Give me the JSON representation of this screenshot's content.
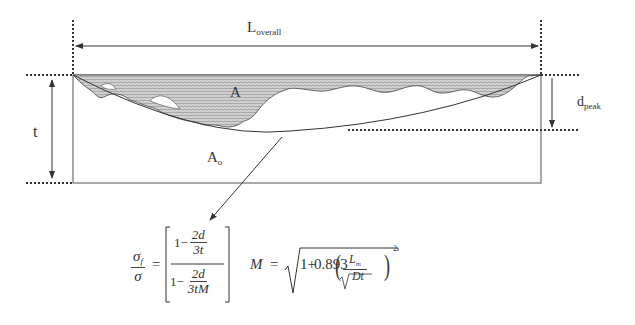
{
  "diagram": {
    "labels": {
      "length_main": "L",
      "length_sub": "overall",
      "area_corroded": "A",
      "area_original_main": "A",
      "area_original_sub": "o",
      "thickness": "t",
      "depth_main": "d",
      "depth_sub": "peak"
    },
    "formula_stress": {
      "lhs_num_main": "σ",
      "lhs_num_sub": "f",
      "lhs_den": "σ",
      "equals": "=",
      "inner_top_one": "1−",
      "inner_top_num": "2d",
      "inner_top_den": "3t",
      "inner_bot_one": "1−",
      "inner_bot_num": "2d",
      "inner_bot_den": "3tM"
    },
    "formula_folias": {
      "lhs": "M",
      "equals": "=",
      "const_one": "1+",
      "coef": "0.893",
      "frac_num_main": "L",
      "frac_num_sub": "m",
      "frac_den": "Dt",
      "power": "2"
    },
    "colors": {
      "line": "#333333",
      "hatch_fill": "#b8b8b8",
      "background": "#ffffff"
    }
  }
}
